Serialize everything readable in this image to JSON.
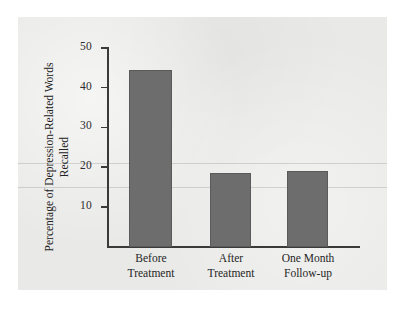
{
  "figure": {
    "panel_background": "#e9e9e7",
    "page_background": "#ffffff",
    "bar_color": "#6d6d6d",
    "axis_color": "#3a3a3a"
  },
  "chart_data": {
    "type": "bar",
    "title": "",
    "xlabel": "",
    "ylabel": "Percentage of Depression-Related Words Recalled",
    "ylabel_lines": [
      "Percentage of Depression-Related",
      "Words Recalled"
    ],
    "categories": [
      "Before Treatment",
      "After Treatment",
      "One Month Follow-up"
    ],
    "category_lines": [
      [
        "Before",
        "Treatment"
      ],
      [
        "After",
        "Treatment"
      ],
      [
        "One Month",
        "Follow-up"
      ]
    ],
    "values": [
      44.5,
      18.5,
      19.0
    ],
    "ylim": [
      0,
      50
    ],
    "yticks": [
      10,
      20,
      30,
      40,
      50
    ],
    "ytick_labels": [
      "10",
      "20",
      "30",
      "40",
      "50"
    ],
    "grid": false,
    "legend": false,
    "series": [
      {
        "name": "Percentage of Depression-Related Words Recalled",
        "values": [
          44.5,
          18.5,
          19.0
        ]
      }
    ]
  }
}
